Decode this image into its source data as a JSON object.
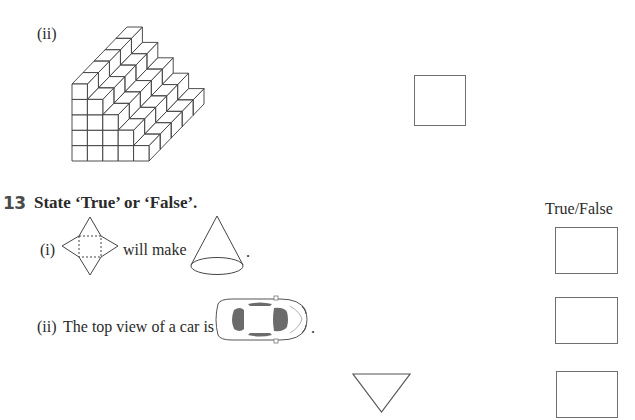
{
  "part_ii_top": {
    "label": "(ii)",
    "figure": "staircase-cube-stack",
    "answer_box": ""
  },
  "question_13": {
    "number": "13",
    "instruction": "State ‘True’ or ‘False’.",
    "column_header": "True/False",
    "items": [
      {
        "label": "(i)",
        "text_before": "",
        "middle_text": "will make",
        "text_after": ".",
        "figure_left": "square-pyramid-net",
        "figure_right": "cone",
        "answer": ""
      },
      {
        "label": "(ii)",
        "text_before": "The top view of a car is",
        "figure": "car-top-view",
        "text_after": ".",
        "answer": ""
      },
      {
        "label": "",
        "figure": "inverted-triangle",
        "answer": ""
      }
    ]
  }
}
